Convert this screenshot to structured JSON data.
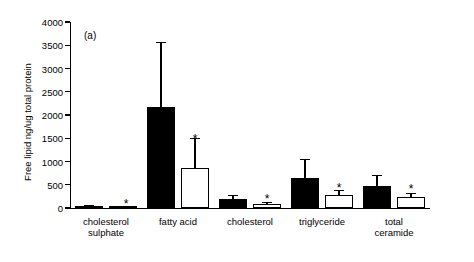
{
  "chart_data": {
    "type": "bar",
    "title": "",
    "panel_label": "(a)",
    "xlabel": "",
    "ylabel": "Free lipid ng/ug total protein",
    "ylim": [
      0,
      4000
    ],
    "yticks": [
      0,
      500,
      1000,
      1500,
      2000,
      2500,
      3000,
      3500,
      4000
    ],
    "grid": false,
    "legend": "none",
    "categories": [
      "cholesterol sulphate",
      "fatty acid",
      "cholesterol",
      "triglyceride",
      "total ceramide"
    ],
    "category_lines": [
      [
        "cholesterol",
        "sulphate"
      ],
      [
        "fatty acid"
      ],
      [
        "cholesterol"
      ],
      [
        "triglyceride"
      ],
      [
        "total",
        "ceramide"
      ]
    ],
    "series": [
      {
        "name": "solid",
        "fill": "#000000",
        "values": [
          40,
          2180,
          195,
          650,
          470
        ],
        "errors": [
          25,
          1400,
          90,
          410,
          240
        ],
        "significance": [
          "",
          "",
          "",
          "",
          ""
        ]
      },
      {
        "name": "open",
        "fill": "#ffffff",
        "values": [
          18,
          860,
          85,
          270,
          240
        ],
        "errors": [
          12,
          640,
          45,
          110,
          90
        ],
        "significance": [
          "*",
          "*",
          "*",
          "*",
          "*"
        ]
      }
    ],
    "star_marks": [
      {
        "group": 0,
        "value": 210,
        "offset": "between"
      },
      {
        "group": 1,
        "value": 1620,
        "offset": "open"
      },
      {
        "group": 2,
        "value": 330,
        "offset": "open"
      },
      {
        "group": 3,
        "value": 560,
        "offset": "open"
      },
      {
        "group": 4,
        "value": 530,
        "offset": "open"
      }
    ]
  }
}
